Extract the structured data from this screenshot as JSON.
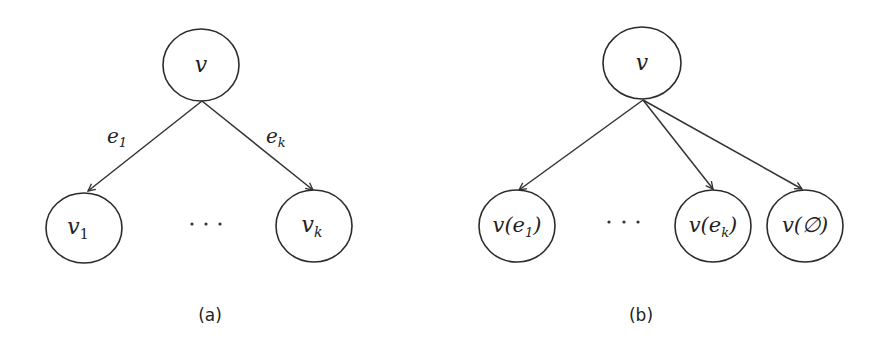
{
  "figure": {
    "panels": [
      {
        "id": "a",
        "caption": "(a)",
        "root": {
          "label": "v"
        },
        "children": [
          {
            "label": "v",
            "sub": "1",
            "edge_label": "e",
            "edge_sub": "1"
          },
          {
            "label": "v",
            "sub": "k",
            "edge_label": "e",
            "edge_sub": "k"
          }
        ],
        "ellipsis": "···"
      },
      {
        "id": "b",
        "caption": "(b)",
        "root": {
          "label": "v"
        },
        "children": [
          {
            "label_prefix": "v(e",
            "sub": "1",
            "label_suffix": ")"
          },
          {
            "label_prefix": "v(e",
            "sub": "k",
            "label_suffix": ")"
          },
          {
            "label": "v(∅)"
          }
        ],
        "ellipsis": "···"
      }
    ]
  },
  "colors": {
    "stroke": "#2b2b2b",
    "background": "#ffffff",
    "text": "#222222"
  }
}
